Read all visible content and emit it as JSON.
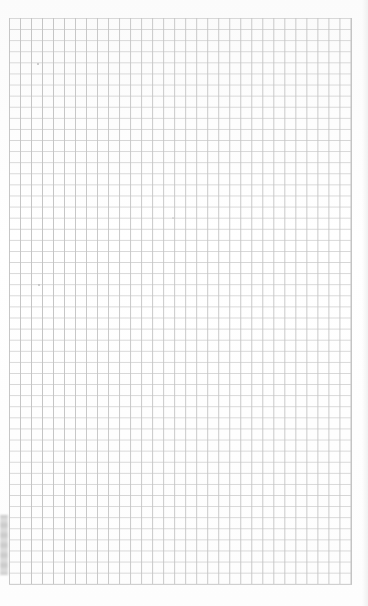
{
  "sheet": {
    "type": "grid-paper",
    "columns": 31,
    "rows": 51,
    "cell_size_px": 11,
    "colors": {
      "paper": "#fdfdfd",
      "vertical_lines": "#c4c4c4",
      "horizontal_lines": "#d6d6d6",
      "binding_shadow": "#bdbdbd"
    }
  }
}
